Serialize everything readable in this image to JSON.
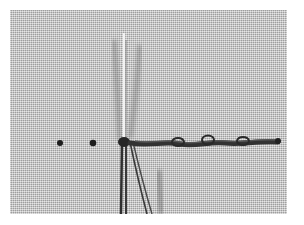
{
  "image": {
    "subject": "Needle and thread with knotted stitches on woven fabric",
    "colors": {
      "background": "#ffffff",
      "fabric": "#c9c9c9",
      "thread": "#3a3a3a",
      "needle": "#f2f2f2",
      "dot": "#1e1e1e"
    },
    "elements": {
      "dots": [
        {
          "x": 50,
          "y": 133
        },
        {
          "x": 83,
          "y": 133
        }
      ],
      "needle": {
        "x": 114,
        "y_top": 23,
        "y_bottom": 204
      },
      "stitch_line": {
        "x_start": 125,
        "x_end": 268,
        "y": 133,
        "knots_x": [
          168,
          198,
          233
        ]
      }
    }
  }
}
